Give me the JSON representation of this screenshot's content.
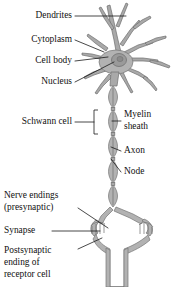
{
  "figure": {
    "background_color": "#ffffff",
    "cell_fill_color": "#a9a9a9",
    "outline_color": "#6f6f6f",
    "label_color": "#111111"
  },
  "labels_left": [
    {
      "id": "dendrites",
      "text": "Dendrites",
      "x": 72,
      "y": 16
    },
    {
      "id": "cytoplasm",
      "text": "Cytoplasm",
      "x": 72,
      "y": 40
    },
    {
      "id": "cell-body",
      "text": "Cell body",
      "x": 72,
      "y": 61
    },
    {
      "id": "nucleus",
      "text": "Nucleus",
      "x": 72,
      "y": 82
    },
    {
      "id": "schwann-cell",
      "text": "Schwann cell",
      "x": 72,
      "y": 122
    }
  ],
  "labels_right": [
    {
      "id": "myelin-sheath-line1",
      "text": "Myelin",
      "x": 124,
      "y": 115
    },
    {
      "id": "myelin-sheath-line2",
      "text": "sheath",
      "x": 124,
      "y": 127
    },
    {
      "id": "axon",
      "text": "Axon",
      "x": 124,
      "y": 151
    },
    {
      "id": "node",
      "text": "Node",
      "x": 124,
      "y": 172
    }
  ],
  "labels_bottom": [
    {
      "id": "nerve-endings-line1",
      "text": "Nerve endings",
      "x": 4,
      "y": 196
    },
    {
      "id": "nerve-endings-line2",
      "text": "(presynaptic)",
      "x": 4,
      "y": 208
    },
    {
      "id": "synapse",
      "text": "Synapse",
      "x": 4,
      "y": 231
    },
    {
      "id": "postsynaptic-line1",
      "text": "Postsynaptic",
      "x": 4,
      "y": 251
    },
    {
      "id": "postsynaptic-line2",
      "text": "ending of",
      "x": 4,
      "y": 263
    },
    {
      "id": "postsynaptic-line3",
      "text": "receptor cell",
      "x": 4,
      "y": 275
    }
  ],
  "structures": {
    "dendrites": "branching processes at top of cell body",
    "soma": "oval cell body with nucleus",
    "nucleus": "round organelle inside soma",
    "axon": "long process descending from soma",
    "myelin_segments": 5,
    "nodes": "gaps between myelin segments",
    "terminals": "two presynaptic bouton clusters",
    "postsynaptic_cell": "receptor cell trunk at bottom"
  }
}
